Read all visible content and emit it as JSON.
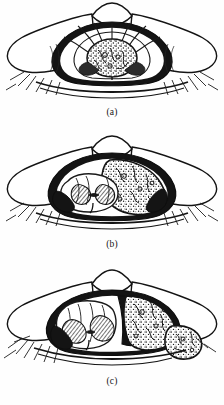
{
  "figure": {
    "background_color": "#fefefe",
    "ink_color": "#111111",
    "fill_light": "#ffffff",
    "fill_dark": "#141414",
    "fill_stipple": "#2a2a2a",
    "panels": [
      {
        "id": "a",
        "caption": "(a)",
        "subject": "vertebral-cross-section-intramedullary-tumor",
        "description": "Axial cross-section of vertebra and spinal canal with a rounded stippled intramedullary mass occupying the centre of the spinal cord; dural sac outlined, nerve roots radiating superiorly, epidural fat shown as dark wedges laterally, transverse processes extending to both sides with fibrous muscle hatching.",
        "elements": [
          "spinous-process",
          "vertebral-lamina",
          "dural-sac-outline",
          "spinal-cord",
          "intramedullary-tumor-mass",
          "nerve-root-fibers",
          "epidural-space-dark",
          "transverse-process-left",
          "transverse-process-right",
          "paraspinal-muscle-hatching",
          "vertebral-body-base"
        ]
      },
      {
        "id": "b",
        "caption": "(b)",
        "subject": "vertebral-cross-section-intradural-extramedullary-tumor",
        "description": "Axial cross-section with a large stippled intradural extramedullary mass filling the right half of the dural sac and displacing the butterfly-shaped spinal cord down and to the left; cord gray matter shown with cross-hatching; dura outlined in heavy ink with dark epidural wedges.",
        "elements": [
          "spinous-process",
          "vertebral-lamina",
          "dural-sac-outline",
          "displaced-spinal-cord",
          "cord-gray-matter-hatching",
          "intradural-extramedullary-tumor-mass",
          "epidural-space-dark",
          "transverse-process-left",
          "transverse-process-right",
          "paraspinal-muscle-hatching",
          "vertebral-body-base"
        ]
      },
      {
        "id": "c",
        "caption": "(c)",
        "subject": "vertebral-cross-section-extradural-tumor",
        "description": "Axial cross-section with a stippled extradural tumor occupying the right side of the canal and extending through the intervertebral foramen as a dumbbell lobe outside the canal; the dural sac and spinal cord are compressed and pushed to the left, cord gray matter cross-hatched.",
        "elements": [
          "spinous-process",
          "vertebral-lamina",
          "dural-sac-outline",
          "compressed-spinal-cord",
          "cord-gray-matter-hatching",
          "extradural-tumor-mass",
          "extraforaminal-tumor-lobe",
          "epidural-space-dark",
          "transverse-process-left",
          "transverse-process-right",
          "paraspinal-muscle-hatching",
          "vertebral-body-base"
        ]
      }
    ]
  }
}
